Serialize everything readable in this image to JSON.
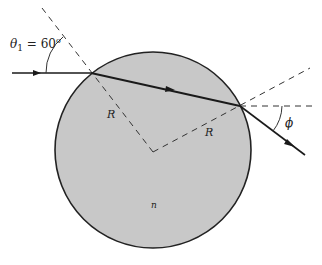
{
  "diagram": {
    "type": "optics-refraction-sphere",
    "colors": {
      "background": "#ffffff",
      "sphere_fill": "#c8c8c8",
      "sphere_stroke": "#222222",
      "ray": "#1a1a1a",
      "dashed": "#333333"
    },
    "sphere": {
      "cx": 153,
      "cy": 150,
      "r": 98
    },
    "labels": {
      "theta1": "θ₁ = 60°",
      "theta1_symbol": "θ",
      "theta1_subscript": "1",
      "theta1_value": " = 60",
      "theta1_degree": "o",
      "radius_left": "R",
      "radius_right": "R",
      "index": "n",
      "exit_angle": "ϕ"
    },
    "incident_ray": {
      "from": [
        12,
        73
      ],
      "to": [
        91,
        73
      ]
    },
    "interior_ray": {
      "from": [
        91,
        73
      ],
      "to": [
        240,
        106
      ]
    },
    "exit_ray": {
      "from": [
        240,
        106
      ],
      "to": [
        305,
        155
      ]
    },
    "entry_normal": {
      "from": [
        42,
        8
      ],
      "to": [
        153,
        152
      ]
    },
    "exit_normal_extended": {
      "from": [
        153,
        152
      ],
      "to": [
        310,
        68
      ]
    },
    "exit_horizontal_reference": {
      "from": [
        240,
        106
      ],
      "to": [
        315,
        106
      ]
    }
  }
}
